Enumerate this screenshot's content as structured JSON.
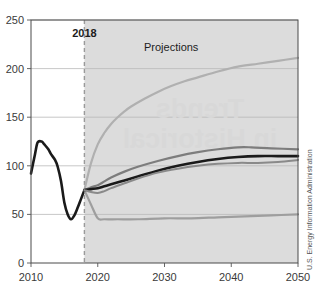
{
  "chart_data": {
    "type": "line",
    "title": "",
    "xlabel": "",
    "ylabel": "",
    "xlim": [
      2010,
      2050
    ],
    "ylim": [
      0,
      250
    ],
    "grid": true,
    "legend_position": "none",
    "x_ticks": [
      "2010",
      "2020",
      "2030",
      "2040",
      "2050"
    ],
    "y_ticks": [
      "0",
      "50",
      "100",
      "150",
      "200",
      "250"
    ],
    "annotations": [
      {
        "name": "history-projection-divider-label",
        "text": "2018",
        "x": 2018,
        "y": 232
      },
      {
        "name": "projections-region-label",
        "text": "Projections",
        "x": 2031,
        "y": 218
      }
    ],
    "shaded_region": {
      "name": "projections-shading",
      "from": 2018,
      "to": 2050,
      "color": "#dcdcdc"
    },
    "divider_line": {
      "name": "year-2018-divider",
      "x": 2018,
      "style": "dashed",
      "color": "#9a9a9a"
    },
    "source_note": "U.S. Energy Information Administration",
    "watermark": "Trends in Historical",
    "series": [
      {
        "name": "History",
        "color": "#1a1a1a",
        "width": 2.6,
        "x": [
          2010,
          2010.6,
          2011,
          2011.6,
          2012,
          2012.6,
          2013,
          2013.6,
          2014,
          2014.5,
          2015,
          2015.5,
          2016,
          2016.5,
          2017,
          2017.5,
          2018
        ],
        "values": [
          92,
          112,
          124,
          125,
          122,
          117,
          112,
          106,
          99,
          84,
          62,
          50,
          45,
          49,
          57,
          66,
          75
        ]
      },
      {
        "name": "High Oil Price",
        "color": "#b0b0b0",
        "width": 2.2,
        "x": [
          2018,
          2019,
          2020,
          2021,
          2022,
          2023,
          2024,
          2025,
          2027,
          2029,
          2031,
          2033,
          2035,
          2038,
          2041,
          2044,
          2047,
          2050
        ],
        "values": [
          75,
          103,
          122,
          134,
          143,
          150,
          156,
          161,
          169,
          176,
          182,
          187,
          191,
          197,
          202,
          205,
          208,
          211
        ]
      },
      {
        "name": "Low Oil Price",
        "color": "#9e9e9e",
        "width": 2.2,
        "x": [
          2018,
          2019,
          2020,
          2021,
          2023,
          2026,
          2030,
          2034,
          2038,
          2042,
          2046,
          2050
        ],
        "values": [
          75,
          60,
          46,
          45,
          45,
          45,
          46,
          46,
          47,
          48,
          49,
          50
        ]
      },
      {
        "name": "High Oil and Gas Supply",
        "color": "#7d7d7d",
        "width": 2.2,
        "x": [
          2018,
          2019,
          2020,
          2021,
          2022,
          2024,
          2026,
          2029,
          2032,
          2035,
          2038,
          2041,
          2043,
          2046,
          2050
        ],
        "values": [
          75,
          78,
          80,
          84,
          88,
          94,
          99,
          105,
          110,
          114,
          117,
          119,
          119,
          118,
          117
        ]
      },
      {
        "name": "Reference",
        "color": "#1a1a1a",
        "width": 2.6,
        "x": [
          2018,
          2019,
          2020,
          2021,
          2022,
          2024,
          2026,
          2029,
          2032,
          2035,
          2038,
          2041,
          2044,
          2047,
          2050
        ],
        "values": [
          75,
          76,
          77,
          79,
          81,
          85,
          89,
          95,
          100,
          104,
          107,
          109,
          110,
          110,
          110
        ]
      },
      {
        "name": "Low Oil and Gas Supply",
        "color": "#8a8a8a",
        "width": 2.0,
        "x": [
          2018,
          2019,
          2020,
          2021,
          2022,
          2024,
          2026,
          2029,
          2032,
          2035,
          2038,
          2041,
          2044,
          2047,
          2050
        ],
        "values": [
          75,
          73,
          72,
          74,
          77,
          82,
          87,
          93,
          97,
          100,
          102,
          103,
          103,
          104,
          106
        ]
      }
    ]
  }
}
